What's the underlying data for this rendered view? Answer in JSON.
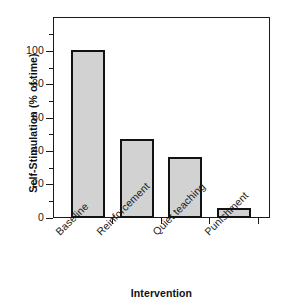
{
  "chart_data": {
    "type": "bar",
    "title": "",
    "subtitle": "",
    "categories": [
      "Baseline",
      "Reinforcement",
      "Quiet teaching",
      "Punishment"
    ],
    "values": [
      96,
      45,
      35,
      6
    ],
    "xlabel": "Intervention",
    "ylabel": "Self-Stimulation (% of time)",
    "ylim": [
      0,
      115
    ],
    "yticks": [
      0,
      20,
      40,
      60,
      80,
      100
    ],
    "ytick_labels": [
      "0",
      "20",
      "40",
      "60",
      "80",
      "100"
    ],
    "yminor_ticks": [
      10,
      30,
      50,
      70,
      90,
      110
    ],
    "grid": false,
    "legend": null,
    "bar_fill_color": "#d2d2d2",
    "bar_edge_color": "#121212",
    "axis_color": "#1a1a1a",
    "background_color": "#ffffff",
    "xtick_label_rotation": -45
  }
}
